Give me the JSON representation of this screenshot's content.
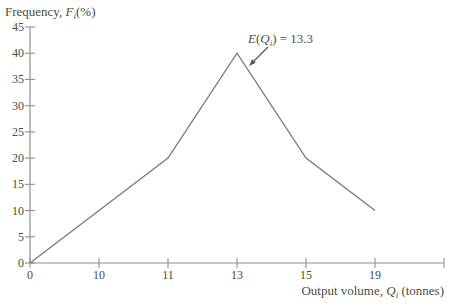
{
  "chart_data": {
    "type": "line",
    "title": "",
    "ylabel_runs": [
      {
        "text": "Frequency, "
      },
      {
        "text": "F",
        "italic": true
      },
      {
        "text": "i",
        "italic": true,
        "sub": true
      },
      {
        "text": "(%)"
      }
    ],
    "xlabel_runs": [
      {
        "text": "Output volume, "
      },
      {
        "text": "Q",
        "italic": true
      },
      {
        "text": "i",
        "italic": true,
        "sub": true
      },
      {
        "text": " (tonnes)"
      }
    ],
    "ylabel_text": "Frequency, Fi (%)",
    "xlabel_text": "Output volume, Qi (tonnes)",
    "ylim": [
      0,
      45
    ],
    "y_ticks": [
      0,
      5,
      10,
      15,
      20,
      25,
      30,
      35,
      40,
      45
    ],
    "x_tick_labels": [
      "0",
      "10",
      "11",
      "13",
      "15",
      "19",
      ""
    ],
    "x_tick_note": "ticks equally spaced; last tick unlabeled",
    "points": [
      {
        "x": 0,
        "y": 0
      },
      {
        "x": 10,
        "y": 10
      },
      {
        "x": 11,
        "y": 20
      },
      {
        "x": 13,
        "y": 40
      },
      {
        "x": 15,
        "y": 20
      },
      {
        "x": 19,
        "y": 10
      }
    ],
    "annotation": {
      "runs": [
        {
          "text": "E",
          "italic": true
        },
        {
          "text": "("
        },
        {
          "text": "Q",
          "italic": true
        },
        {
          "text": "i",
          "italic": true,
          "sub": true
        },
        {
          "text": ") = 13.3"
        }
      ],
      "text": "E(Qi) = 13.3",
      "value": 13.3,
      "points_to": {
        "x": 13,
        "y": 40
      }
    },
    "legend": null,
    "grid": false,
    "colors": {
      "axis": "#8f8f8f",
      "line": "#7a7a7a",
      "text": "#4e4c42",
      "arrow": "#55534a",
      "background": "#ffffff"
    }
  }
}
